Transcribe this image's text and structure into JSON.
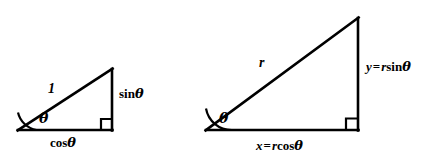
{
  "figure": {
    "background_color": "#ffffff",
    "stroke_color": "#000000",
    "text_color": "#000000"
  },
  "diagram_data": {
    "type": "diagram",
    "shapes": [
      {
        "name": "unit-triangle",
        "kind": "right-triangle",
        "vertices": {
          "left": [
            18,
            130
          ],
          "right_angle": [
            112,
            130
          ],
          "apex": [
            112,
            69
          ]
        },
        "angle_mark": "arc",
        "right_angle_mark": "square"
      },
      {
        "name": "scaled-triangle",
        "kind": "right-triangle",
        "vertices": {
          "left": [
            206,
            130
          ],
          "right_angle": [
            358,
            130
          ],
          "apex": [
            358,
            18
          ]
        },
        "angle_mark": "arc",
        "right_angle_mark": "square"
      }
    ]
  },
  "labels": {
    "left_triangle": {
      "hypotenuse": "1",
      "angle": "θ",
      "opposite_fn": "sin",
      "opposite_arg": "θ",
      "adjacent_fn": "cos",
      "adjacent_arg": "θ"
    },
    "right_triangle": {
      "hypotenuse": "r",
      "angle": "θ",
      "opposite_var": "y",
      "opposite_eq": "=",
      "opposite_scale": "r",
      "opposite_fn": "sin",
      "opposite_arg": "θ",
      "adjacent_var": "x",
      "adjacent_eq": "=",
      "adjacent_scale": "r",
      "adjacent_fn": "cos",
      "adjacent_arg": "θ"
    }
  }
}
